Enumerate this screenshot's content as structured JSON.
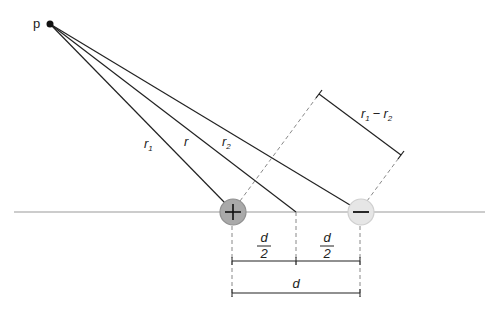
{
  "diagram": {
    "type": "electric-dipole-geometry",
    "point_label": "p",
    "distance_labels": {
      "r1": "r",
      "r1_sub": "1",
      "r": "r",
      "r2": "r",
      "r2_sub": "2"
    },
    "difference_label": {
      "a": "r",
      "a_sub": "1",
      "minus": "−",
      "b": "r",
      "b_sub": "2"
    },
    "positive_charge": {
      "symbol": "+",
      "fill": "#a9a9a9",
      "stroke": "#8f8f8f"
    },
    "negative_charge": {
      "symbol": "−",
      "fill": "#e6e6e6",
      "stroke": "#cfcfcf"
    },
    "half_separation": {
      "num": "d",
      "den": "2"
    },
    "separation_label": "d",
    "colors": {
      "line": "#222222",
      "axis": "#999999",
      "dashed": "#888888"
    }
  }
}
